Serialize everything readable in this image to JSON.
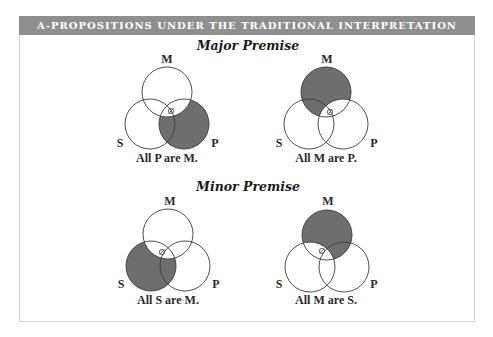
{
  "header": {
    "title": "A-PROPOSITIONS UNDER THE TRADITIONAL INTERPRETATION"
  },
  "sections": [
    {
      "title": "Major Premise",
      "diagrams": [
        {
          "caption": "All P are M.",
          "labels": {
            "top": "M",
            "left": "S",
            "right": "P"
          },
          "shaded": "P outside M",
          "marker": "⊗"
        },
        {
          "caption": "All M are P.",
          "labels": {
            "top": "M",
            "left": "S",
            "right": "P"
          },
          "shaded": "M outside P",
          "marker": "⊗"
        }
      ]
    },
    {
      "title": "Minor Premise",
      "diagrams": [
        {
          "caption": "All S are M.",
          "labels": {
            "top": "M",
            "left": "S",
            "right": "P"
          },
          "shaded": "S outside M",
          "marker": "⊗"
        },
        {
          "caption": "All M are S.",
          "labels": {
            "top": "M",
            "left": "S",
            "right": "P"
          },
          "shaded": "M outside S",
          "marker": "⊗"
        }
      ]
    }
  ],
  "colors": {
    "header_bg": "#8f8f8f",
    "shade": "#6e6e6e",
    "stroke": "#3a3a3a"
  }
}
